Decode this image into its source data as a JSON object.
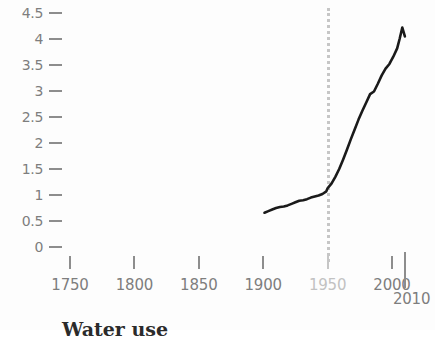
{
  "chart_data": {
    "type": "line",
    "title": "",
    "subtitle": "",
    "xlabel": "",
    "ylabel": "",
    "xlim": [
      1735,
      2012
    ],
    "ylim": [
      0,
      4.5
    ],
    "grid": false,
    "legend": null,
    "y_ticks": [
      "4.5",
      "4",
      "3.5",
      "3",
      "2.5",
      "2",
      "1.5",
      "1",
      "0.5",
      "0"
    ],
    "y_tick_values": [
      4.5,
      4,
      3.5,
      3,
      2.5,
      2,
      1.5,
      1,
      0.5,
      0
    ],
    "x_ticks": [
      "1750",
      "1800",
      "1850",
      "1900",
      "1950",
      "2000"
    ],
    "x_tick_values": [
      1750,
      1800,
      1850,
      1900,
      1950,
      2000
    ],
    "x_tick_muted": [
      false,
      false,
      false,
      false,
      true,
      false
    ],
    "end_marker": {
      "label": "2010",
      "value": 2010
    },
    "annotations": [
      {
        "type": "vertical-dashed-line",
        "x": 1950,
        "label": "1950",
        "color": "#c6c6c6"
      }
    ],
    "series": [
      {
        "name": "series-1",
        "color": "#1a1a1a",
        "x": [
          1901,
          1904,
          1907,
          1910,
          1913,
          1916,
          1919,
          1922,
          1925,
          1928,
          1931,
          1934,
          1937,
          1940,
          1943,
          1946,
          1949,
          1950,
          1953,
          1956,
          1959,
          1962,
          1965,
          1968,
          1971,
          1974,
          1977,
          1980,
          1983,
          1986,
          1989,
          1992,
          1995,
          1998,
          2001,
          2004,
          2006,
          2008,
          2010
        ],
        "y": [
          0.66,
          0.69,
          0.72,
          0.75,
          0.77,
          0.78,
          0.8,
          0.83,
          0.86,
          0.89,
          0.9,
          0.92,
          0.95,
          0.97,
          0.99,
          1.02,
          1.07,
          1.13,
          1.22,
          1.35,
          1.5,
          1.68,
          1.87,
          2.07,
          2.26,
          2.45,
          2.62,
          2.78,
          2.94,
          2.99,
          3.14,
          3.3,
          3.43,
          3.52,
          3.66,
          3.82,
          4.01,
          4.22,
          4.05
        ]
      }
    ]
  },
  "caption": {
    "text": "Water use"
  },
  "colors": {
    "line": "#1a1a1a",
    "axis": "#8d8d8d",
    "tick_text": "#7e7e7e",
    "muted_text": "#c2c2c2",
    "marker": "#c6c6c6"
  }
}
